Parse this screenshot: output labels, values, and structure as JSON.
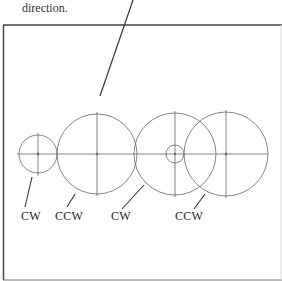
{
  "caption": {
    "text": "direction."
  },
  "gears": [
    {
      "id": "gear-1",
      "cx": 38,
      "cy": 154,
      "r": 19,
      "direction": "CW"
    },
    {
      "id": "gear-2",
      "cx": 97,
      "cy": 154,
      "r": 40,
      "direction": "CCW"
    },
    {
      "id": "gear-3",
      "cx": 175,
      "cy": 154,
      "r": 41,
      "direction": "CW",
      "hub_r": 9
    },
    {
      "id": "gear-4",
      "cx": 226,
      "cy": 154,
      "r": 42,
      "direction": "CCW"
    }
  ],
  "labels": [
    {
      "text": "CW",
      "x": 21,
      "y": 209
    },
    {
      "text": "CCW",
      "x": 55,
      "y": 209
    },
    {
      "text": "CW",
      "x": 111,
      "y": 209
    },
    {
      "text": "CCW",
      "x": 175,
      "y": 209
    }
  ],
  "colors": {
    "stroke": "#555555",
    "border": "#444444",
    "text": "#222222"
  }
}
